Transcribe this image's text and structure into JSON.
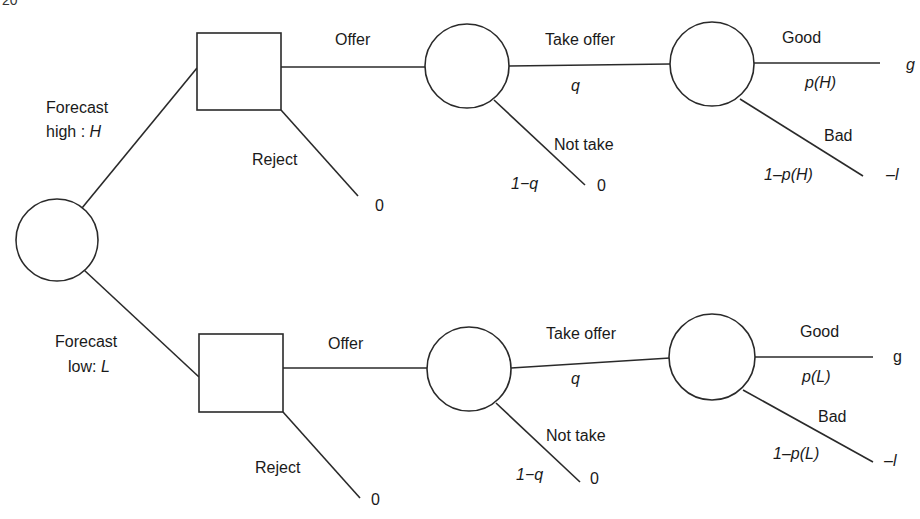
{
  "header": {
    "page_fragment": "20"
  },
  "tree": {
    "root": {
      "type": "chance"
    },
    "branches": [
      {
        "forecast_label_line1": "Forecast",
        "forecast_label_line2_prefix": "high : ",
        "forecast_label_var": "H",
        "decision": {
          "offer_label": "Offer",
          "reject_label": "Reject",
          "reject_payoff": "0"
        },
        "response": {
          "take_label": "Take offer",
          "take_prob": "q",
          "not_take_label": "Not take",
          "not_take_prob": "1−q",
          "not_take_payoff": "0"
        },
        "outcome": {
          "good_label": "Good",
          "good_prob": "p(H)",
          "good_payoff": "g",
          "bad_label": "Bad",
          "bad_prob": "1–p(H)",
          "bad_payoff": "–l"
        }
      },
      {
        "forecast_label_line1": "Forecast",
        "forecast_label_line2_prefix": "low: ",
        "forecast_label_var": "L",
        "decision": {
          "offer_label": "Offer",
          "reject_label": "Reject",
          "reject_payoff": "0"
        },
        "response": {
          "take_label": "Take offer",
          "take_prob": "q",
          "not_take_label": "Not take",
          "not_take_prob": "1−q",
          "not_take_payoff": "0"
        },
        "outcome": {
          "good_label": "Good",
          "good_prob": "p(L)",
          "good_payoff": "g",
          "bad_label": "Bad",
          "bad_prob": "1–p(L)",
          "bad_payoff": "–l"
        }
      }
    ]
  }
}
